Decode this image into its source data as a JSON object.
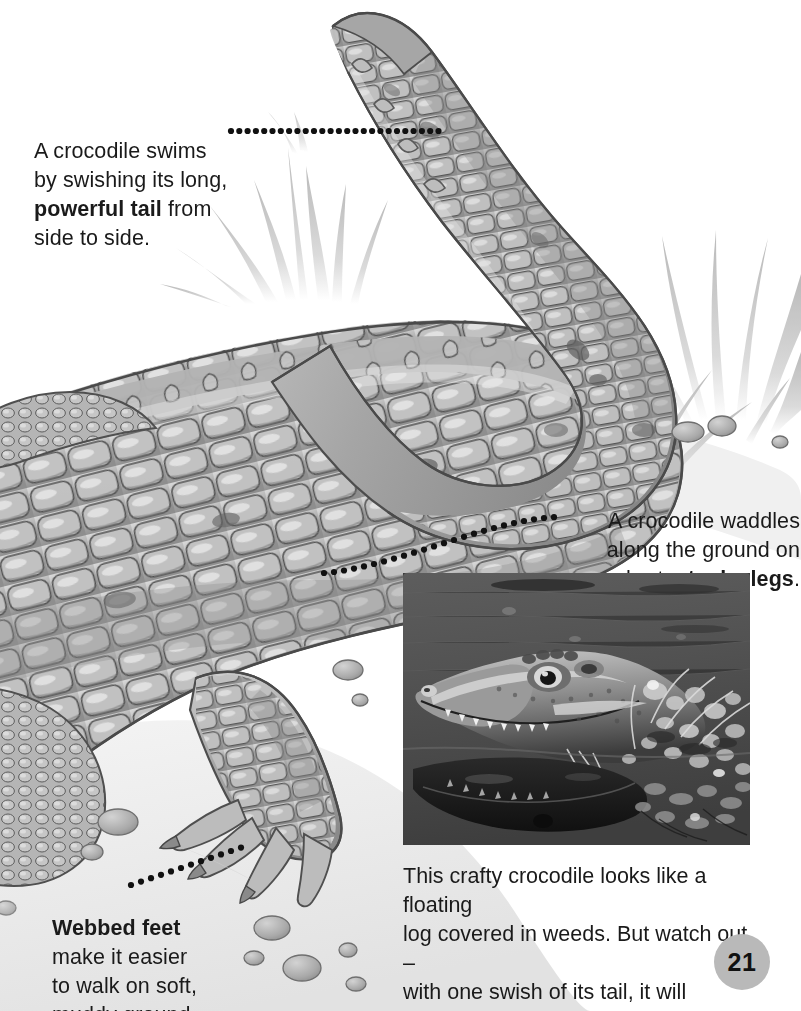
{
  "page": {
    "number": "21",
    "background_color": "#ffffff",
    "text_color": "#1a1a1a",
    "badge_color": "#b9b9b9"
  },
  "callouts": [
    {
      "id": "tail",
      "name": "callout-powerful-tail",
      "lines": [
        "A crocodile swims",
        "by swishing its long,",
        "powerful tail from",
        "side to side."
      ],
      "text": "A crocodile swims\nby swishing its long,\npowerful tail from\nside to side.",
      "bold_phrase": "powerful tail",
      "leader_dots": 30
    },
    {
      "id": "legs",
      "name": "callout-stocky-legs",
      "lines": [
        "A crocodile waddles",
        "along the ground on",
        "short, stocky legs."
      ],
      "text": "A crocodile waddles\nalong the ground on\nshort, stocky legs.",
      "bold_phrase": "stocky legs",
      "leader_dots": 26
    },
    {
      "id": "feet",
      "name": "callout-webbed-feet",
      "lines": [
        "Webbed feet",
        "make it easier",
        "to walk on soft,",
        "muddy ground."
      ],
      "text": "Webbed feet\nmake it easier\nto walk on soft,\nmuddy ground.",
      "bold_phrase": "Webbed feet",
      "leader_dots": 14
    }
  ],
  "photo": {
    "name": "crocodile-head-photo",
    "subject": "crocodile head floating in water among weeds with reflection",
    "style": "black-and-white photograph",
    "caption": "This crafty crocodile looks like a floating\nlog covered in weeds. But watch out –\nwith one swish of its tail, it will pounce!",
    "caption_lines": [
      "This crafty crocodile looks like a floating",
      "log covered in weeds. But watch out –",
      "with one swish of its tail, it will pounce!"
    ]
  },
  "illustration": {
    "name": "crocodile-illustration",
    "subject": "grayscale watercolor crocodile seen from above with long curving tail, scaly armored back, stocky leg and webbed foot",
    "elements": [
      "crocodile-body",
      "curving-tail",
      "grass-tufts",
      "pebbles",
      "webbed-foot",
      "ground-shadow"
    ],
    "palette": {
      "scale_light": "#d9d9d9",
      "scale_mid": "#a8a8a8",
      "scale_dark": "#7d7d7d",
      "outline": "#4a4a4a",
      "grass": "#c9c9c9",
      "ground": "#ededed",
      "pebble": "#b0b0b0"
    }
  }
}
